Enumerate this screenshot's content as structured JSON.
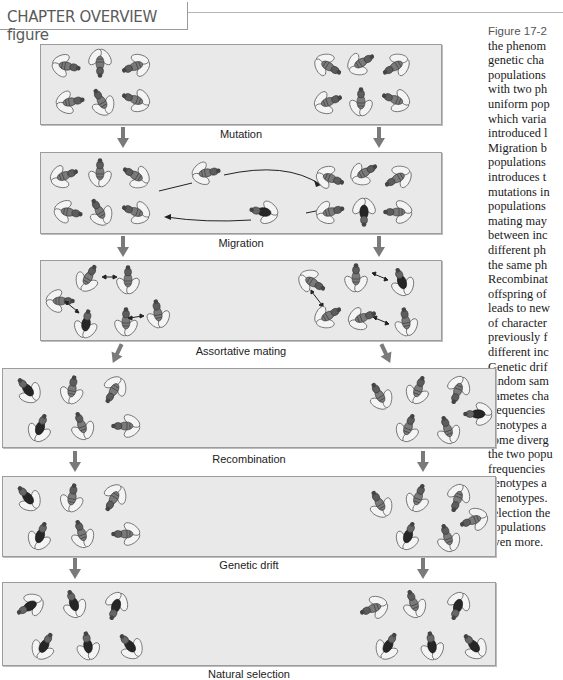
{
  "header": {
    "title": "CHAPTER OVERVIEW figure"
  },
  "caption": {
    "figure_label": "Figure 17-2",
    "lines": [
      "the phenom",
      "genetic cha",
      "populations",
      "with two ph",
      "uniform pop",
      "which varia",
      "introduced l",
      "Migration b",
      "populations",
      "introduces t",
      "mutations in",
      "populations",
      "mating may",
      "between inc",
      "different ph",
      "the same ph",
      "Recombinat",
      "offspring of",
      "leads to new",
      "of character",
      "previously f",
      "different inc",
      "Genetic drif",
      "random sam",
      "gametes cha",
      "frequencies",
      "genotypes a",
      "some diverg",
      "the two popu",
      "frequencies",
      "genotypes a",
      "phenotypes.",
      "selection the",
      "populations",
      "even more."
    ]
  },
  "stages": [
    {
      "label": "Mutation"
    },
    {
      "label": "Migration"
    },
    {
      "label": "Assortative mating"
    },
    {
      "label": "Recombination"
    },
    {
      "label": "Genetic drift"
    },
    {
      "label": "Natural selection"
    }
  ],
  "icons": {
    "fly": "fruit-fly-icon",
    "arrow": "down-arrow-icon"
  },
  "colors": {
    "panel_bg": "#e9e9e9",
    "panel_border": "#9c9c9c",
    "arrow": "#7a7a7a",
    "fly_body": "#6f6f6f",
    "fly_dark": "#2e2e2e"
  }
}
